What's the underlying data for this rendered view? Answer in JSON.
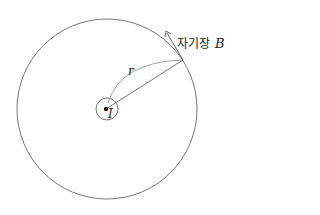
{
  "diagram": {
    "labels": {
      "field_korean": "자기장",
      "field_symbol": "B",
      "radius_symbol": "r",
      "current_symbol": "I"
    },
    "colors": {
      "stroke": "#555555",
      "dot": "#000000",
      "text": "#222222",
      "background": "#ffffff"
    }
  }
}
